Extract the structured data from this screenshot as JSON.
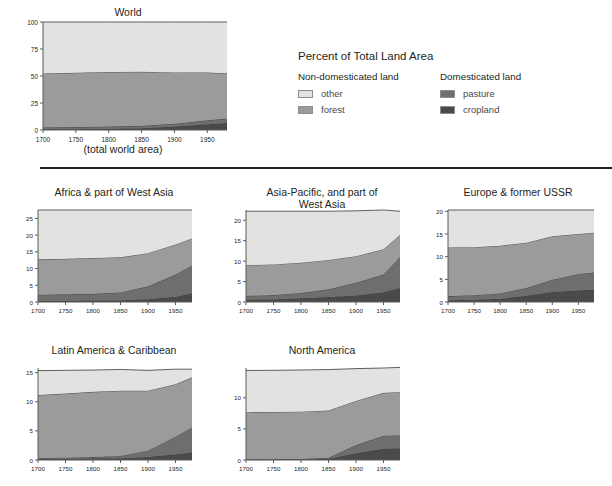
{
  "legend": {
    "title": "Percent of Total Land Area",
    "columns": [
      {
        "heading": "Non-domesticated land",
        "items": [
          {
            "label": "other",
            "color": "#e2e2e1"
          },
          {
            "label": "forest",
            "color": "#9b9b9b"
          }
        ]
      },
      {
        "heading": "Domesticated land",
        "items": [
          {
            "label": "pasture",
            "color": "#6e6e6e"
          },
          {
            "label": "cropland",
            "color": "#4a4a4a"
          }
        ]
      }
    ]
  },
  "world_caption": "(total world area)",
  "chart_data": [
    {
      "id": "world",
      "type": "area",
      "stacked": true,
      "title": "World",
      "xlabel": "(total world area)",
      "ylabel": "",
      "xlim": [
        1700,
        1980
      ],
      "ylim": [
        0,
        100
      ],
      "xticks": [
        1700,
        1750,
        1800,
        1850,
        1900,
        1950
      ],
      "yticks": [
        0,
        25,
        50,
        75,
        100
      ],
      "grid": false,
      "x": [
        1700,
        1750,
        1800,
        1850,
        1900,
        1950,
        1980
      ],
      "series": [
        {
          "name": "cropland",
          "color": "#4a4a4a",
          "values": [
            0.6,
            0.8,
            1.1,
            1.7,
            3.2,
            5.4,
            6.4
          ]
        },
        {
          "name": "pasture",
          "color": "#6e6e6e",
          "values": [
            2.0,
            2.0,
            2.1,
            2.2,
            2.6,
            3.6,
            4.2
          ]
        },
        {
          "name": "forest",
          "color": "#9b9b9b",
          "values": [
            49.6,
            50.2,
            50.5,
            50.0,
            47.5,
            44.2,
            42.0
          ]
        },
        {
          "name": "other",
          "color": "#e2e2e1",
          "values": [
            47.8,
            47.0,
            46.3,
            46.1,
            46.7,
            46.8,
            47.4
          ]
        }
      ]
    },
    {
      "id": "africa",
      "type": "area",
      "stacked": true,
      "title": "Africa & part of West Asia",
      "xlim": [
        1700,
        1980
      ],
      "ylim": [
        0,
        27.5
      ],
      "xticks": [
        1700,
        1750,
        1800,
        1850,
        1900,
        1950
      ],
      "yticks": [
        0,
        5,
        10,
        15,
        20,
        25
      ],
      "grid": false,
      "x": [
        1700,
        1750,
        1800,
        1850,
        1900,
        1950,
        1980
      ],
      "series": [
        {
          "name": "cropland",
          "color": "#4a4a4a",
          "values": [
            0.35,
            0.4,
            0.45,
            0.55,
            0.8,
            1.6,
            2.6
          ]
        },
        {
          "name": "pasture",
          "color": "#6e6e6e",
          "values": [
            1.8,
            1.9,
            2.0,
            2.3,
            3.9,
            6.6,
            8.3
          ]
        },
        {
          "name": "forest",
          "color": "#9b9b9b",
          "values": [
            10.6,
            10.6,
            10.7,
            10.5,
            9.9,
            9.0,
            8.1
          ]
        },
        {
          "name": "other",
          "color": "#e2e2e1",
          "values": [
            14.75,
            14.6,
            14.35,
            14.15,
            12.9,
            10.3,
            8.5
          ]
        }
      ]
    },
    {
      "id": "asia-pacific",
      "type": "area",
      "stacked": true,
      "title": "Asia-Pacific, and part of\nWest Asia",
      "xlim": [
        1700,
        1980
      ],
      "ylim": [
        0,
        22.5
      ],
      "xticks": [
        1700,
        1750,
        1800,
        1850,
        1900,
        1950
      ],
      "yticks": [
        0,
        5,
        10,
        15,
        20,
        25
      ],
      "grid": false,
      "x": [
        1700,
        1750,
        1800,
        1850,
        1900,
        1950,
        1980
      ],
      "series": [
        {
          "name": "cropland",
          "color": "#4a4a4a",
          "values": [
            0.6,
            0.7,
            0.9,
            1.2,
            1.6,
            2.4,
            3.4
          ]
        },
        {
          "name": "pasture",
          "color": "#6e6e6e",
          "values": [
            0.9,
            1.0,
            1.3,
            1.9,
            3.1,
            4.3,
            7.6
          ]
        },
        {
          "name": "forest",
          "color": "#9b9b9b",
          "values": [
            7.5,
            7.5,
            7.4,
            7.2,
            6.5,
            6.2,
            5.4
          ]
        },
        {
          "name": "other",
          "color": "#e2e2e1",
          "values": [
            13.2,
            13.0,
            12.6,
            11.9,
            11.1,
            9.6,
            5.8
          ]
        }
      ]
    },
    {
      "id": "europe-ussr",
      "type": "area",
      "stacked": true,
      "title": "Europe & former USSR",
      "xlim": [
        1700,
        1980
      ],
      "ylim": [
        0,
        20.3
      ],
      "xticks": [
        1700,
        1750,
        1800,
        1850,
        1900,
        1950
      ],
      "yticks": [
        0,
        5,
        10,
        15,
        20,
        25
      ],
      "grid": false,
      "x": [
        1700,
        1750,
        1800,
        1850,
        1900,
        1950,
        1980
      ],
      "series": [
        {
          "name": "cropland",
          "color": "#4a4a4a",
          "values": [
            0.4,
            0.5,
            0.7,
            1.4,
            2.2,
            2.6,
            2.7
          ]
        },
        {
          "name": "pasture",
          "color": "#6e6e6e",
          "values": [
            0.9,
            1.0,
            1.2,
            1.7,
            2.7,
            3.6,
            3.8
          ]
        },
        {
          "name": "forest",
          "color": "#9b9b9b",
          "values": [
            10.7,
            10.6,
            10.5,
            10.0,
            9.6,
            8.8,
            8.8
          ]
        },
        {
          "name": "other",
          "color": "#e2e2e1",
          "values": [
            8.3,
            8.2,
            7.9,
            7.2,
            5.8,
            5.3,
            5.0
          ]
        }
      ]
    },
    {
      "id": "latin-america",
      "type": "area",
      "stacked": true,
      "title": "Latin America & Caribbean",
      "xlim": [
        1700,
        1980
      ],
      "ylim": [
        0,
        15.8
      ],
      "xticks": [
        1700,
        1750,
        1800,
        1850,
        1900,
        1950
      ],
      "yticks": [
        0,
        5,
        10,
        15,
        20,
        25
      ],
      "grid": false,
      "x": [
        1700,
        1750,
        1800,
        1850,
        1900,
        1950,
        1980
      ],
      "series": [
        {
          "name": "cropland",
          "color": "#4a4a4a",
          "values": [
            0.2,
            0.2,
            0.25,
            0.3,
            0.5,
            1.0,
            1.3
          ]
        },
        {
          "name": "pasture",
          "color": "#6e6e6e",
          "values": [
            0.15,
            0.2,
            0.25,
            0.4,
            1.1,
            3.0,
            4.3
          ]
        },
        {
          "name": "forest",
          "color": "#9b9b9b",
          "values": [
            10.8,
            11.0,
            11.2,
            11.2,
            10.3,
            9.0,
            8.6
          ]
        },
        {
          "name": "other",
          "color": "#e2e2e1",
          "values": [
            4.2,
            4.0,
            3.75,
            3.65,
            3.5,
            2.6,
            1.4
          ]
        }
      ]
    },
    {
      "id": "north-america",
      "type": "area",
      "stacked": true,
      "title": "North America",
      "xlim": [
        1700,
        1980
      ],
      "ylim": [
        0,
        14.8
      ],
      "xticks": [
        1700,
        1750,
        1800,
        1850,
        1900,
        1950
      ],
      "yticks": [
        0,
        5,
        10,
        15,
        20,
        25
      ],
      "grid": false,
      "x": [
        1700,
        1750,
        1800,
        1850,
        1900,
        1950,
        1980
      ],
      "series": [
        {
          "name": "cropland",
          "color": "#4a4a4a",
          "values": [
            0.05,
            0.07,
            0.1,
            0.2,
            1.1,
            1.8,
            1.9
          ]
        },
        {
          "name": "pasture",
          "color": "#6e6e6e",
          "values": [
            0.05,
            0.06,
            0.08,
            0.15,
            1.3,
            2.1,
            2.1
          ]
        },
        {
          "name": "forest",
          "color": "#9b9b9b",
          "values": [
            7.6,
            7.6,
            7.6,
            7.6,
            7.1,
            6.9,
            6.9
          ]
        },
        {
          "name": "other",
          "color": "#e2e2e1",
          "values": [
            6.7,
            6.7,
            6.7,
            6.6,
            5.2,
            4.0,
            4.0
          ]
        }
      ]
    }
  ]
}
